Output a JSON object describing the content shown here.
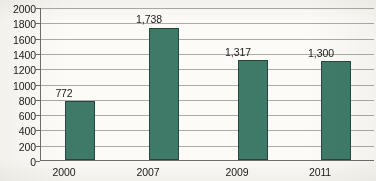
{
  "chart_data": {
    "type": "bar",
    "title": "",
    "subtitle": "",
    "xlabel": "",
    "ylabel": "",
    "categories": [
      "2000",
      "2007",
      "2009",
      "2011"
    ],
    "values": [
      772,
      1738,
      1317,
      1300
    ],
    "value_labels": [
      "772",
      "1,738",
      "1,317",
      "1,300"
    ],
    "series": [
      {
        "name": "",
        "values": [
          772,
          1738,
          1317,
          1300
        ]
      }
    ],
    "ylim": [
      0,
      2000
    ],
    "ytick_step": 200,
    "ytick_labels": [
      "2000",
      "1800",
      "1600",
      "1400",
      "1200",
      "1000",
      "800",
      "600",
      "400",
      "200",
      "0"
    ],
    "ytick_values": [
      2000,
      1800,
      1600,
      1400,
      1200,
      1000,
      800,
      600,
      400,
      200,
      0
    ],
    "grid": true,
    "legend": false,
    "legend_position": "none",
    "bar_color": "#3f7a68",
    "bar_border_color": "#23483d",
    "grid_color": "#8c8c8c",
    "axis_color": "#6d6d6d",
    "background_color": "#fbfaf7",
    "text_color": "#1b1b1b"
  }
}
